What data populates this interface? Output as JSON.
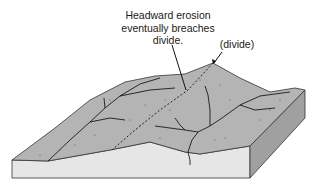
{
  "diagram": {
    "annotations": {
      "headward_erosion": {
        "line1": "Headward erosion",
        "line2": "eventually breaches",
        "line3": "divide."
      },
      "divide": "(divide)"
    },
    "colors": {
      "terrain_top": "#b4b4b4",
      "front_face": "#e6e6e6",
      "side_face": "#a0a0a0",
      "lines": "#1a1a1a"
    }
  }
}
